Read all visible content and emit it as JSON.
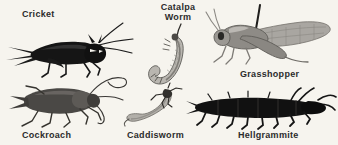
{
  "plate": {
    "background_color": "#f6f4ee",
    "label_color": "#2b2b2b",
    "width": 338,
    "height": 145
  },
  "figures": [
    {
      "id": "cricket",
      "label": "Cricket",
      "body_color": "#151515",
      "accent_color": "#3a3a3a",
      "orientation": "facing-right",
      "position": "top-left"
    },
    {
      "id": "catalpa-worm",
      "label_line_1": "Catalpa",
      "label_line_2": "Worm",
      "body_color": "#b9b6b0",
      "accent_color": "#6e6b66",
      "orientation": "curved-vertical",
      "position": "top-center"
    },
    {
      "id": "grasshopper",
      "label": "Grasshopper",
      "body_color": "#9a9792",
      "accent_color": "#5f5c58",
      "orientation": "facing-left",
      "position": "top-right"
    },
    {
      "id": "cockroach",
      "label": "Cockroach",
      "body_color": "#4a4845",
      "accent_color": "#2a2926",
      "orientation": "facing-right",
      "position": "bottom-left"
    },
    {
      "id": "caddisworm",
      "label": "Caddisworm",
      "body_color": "#b2afa9",
      "accent_color": "#33312e",
      "orientation": "diagonal",
      "position": "bottom-center"
    },
    {
      "id": "hellgrammite",
      "label": "Hellgrammite",
      "body_color": "#111111",
      "accent_color": "#2e2d2b",
      "orientation": "facing-right",
      "position": "bottom-right"
    }
  ]
}
